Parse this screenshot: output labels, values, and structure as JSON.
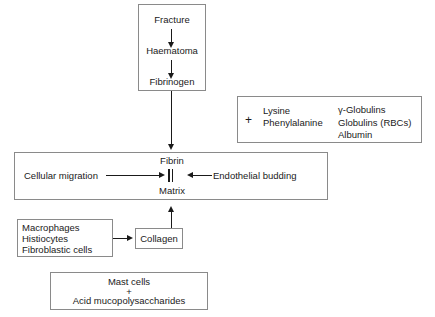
{
  "diagram": {
    "nodes": {
      "fracture": "Fracture",
      "haematoma": "Haematoma",
      "fibrinogen": "Fibrinogen",
      "fibrin": "Fibrin",
      "matrix": "Matrix",
      "cellular_migration": "Cellular migration",
      "endothelial_budding": "Endothelial budding",
      "collagen": "Collagen"
    },
    "additives_box": {
      "plus": "+",
      "column_left": [
        "Lysine",
        "Phenylalanine"
      ],
      "column_right": [
        "γ-Globulins",
        "Globulins  (RBCs)",
        "Albumin"
      ]
    },
    "cells_box": {
      "lines": [
        "Macrophages",
        "Histiocytes",
        "Fibroblastic cells"
      ]
    },
    "mast_box": {
      "lines": [
        "Mast cells",
        "+",
        "Acid mucopolysaccharides"
      ]
    },
    "colors": {
      "stroke": "#8a8a8a",
      "ink": "#1a1a1a",
      "background": "#ffffff"
    }
  }
}
